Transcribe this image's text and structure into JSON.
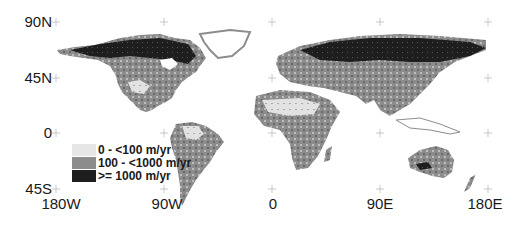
{
  "map": {
    "type": "choropleth-world-map",
    "projection": "equirectangular",
    "y_axis_labels": [
      "90N",
      "45N",
      "0",
      "45S"
    ],
    "x_axis_labels": [
      "180W",
      "90W",
      "0",
      "90E",
      "180E"
    ],
    "grid": "cross-markers",
    "legend": {
      "position": "lower-left",
      "items": [
        {
          "label": "0 - <100 m/yr",
          "color": "#e6e6e6"
        },
        {
          "label": "100 - <1000 m/yr",
          "color": "#8c8c8c"
        },
        {
          "label": ">= 1000 m/yr",
          "color": "#1e1e1e"
        }
      ]
    },
    "colors": {
      "low": "#e6e6e6",
      "mid": "#8c8c8c",
      "high": "#1e1e1e",
      "grid": "#bbbbbb",
      "background": "#ffffff"
    }
  }
}
